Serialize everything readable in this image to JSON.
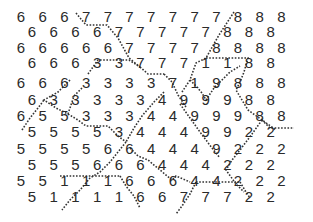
{
  "puzzle": {
    "layout": "offset-rows",
    "cell_spacing_x": 21.7,
    "row_positions_y": [
      18,
      33,
      49,
      64,
      84,
      101,
      117,
      133,
      150,
      166,
      182,
      198
    ],
    "even_row_start_x": 21,
    "odd_row_start_x": 32,
    "rows": [
      [
        6,
        6,
        6,
        7,
        7,
        7,
        7,
        7,
        7,
        7,
        8,
        8,
        8
      ],
      [
        6,
        6,
        6,
        6,
        7,
        7,
        7,
        7,
        7,
        8,
        8,
        8
      ],
      [
        6,
        6,
        6,
        6,
        6,
        7,
        7,
        7,
        7,
        8,
        8,
        8,
        8
      ],
      [
        6,
        6,
        6,
        3,
        3,
        7,
        7,
        7,
        1,
        1,
        8,
        8
      ],
      [
        6,
        6,
        6,
        3,
        3,
        3,
        3,
        7,
        1,
        9,
        8,
        8,
        8
      ],
      [
        6,
        3,
        3,
        3,
        3,
        3,
        4,
        9,
        9,
        9,
        8,
        8
      ],
      [
        6,
        5,
        5,
        3,
        3,
        3,
        4,
        4,
        9,
        9,
        9,
        8,
        8
      ],
      [
        5,
        5,
        5,
        5,
        3,
        4,
        4,
        4,
        9,
        9,
        2,
        2
      ],
      [
        5,
        5,
        5,
        5,
        6,
        6,
        4,
        4,
        4,
        9,
        2,
        2,
        2
      ],
      [
        5,
        5,
        5,
        6,
        6,
        6,
        4,
        4,
        4,
        2,
        2,
        2
      ],
      [
        5,
        5,
        1,
        1,
        1,
        6,
        6,
        6,
        4,
        4,
        2,
        2,
        2
      ],
      [
        5,
        1,
        1,
        1,
        1,
        6,
        6,
        7,
        7,
        7,
        2,
        2
      ]
    ]
  },
  "colors": {
    "text": "#2a2a2a",
    "border": "#333333",
    "background": "#ffffff"
  }
}
